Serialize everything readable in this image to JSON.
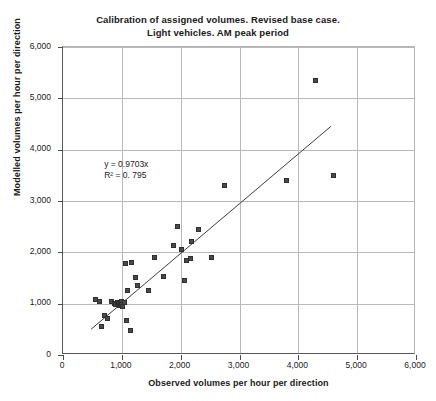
{
  "chart_data": {
    "type": "scatter",
    "title": "Calibration of assigned volumes. Revised base case.\nLight vehicles. AM peak period",
    "title_line1": "Calibration of assigned volumes. Revised base case.",
    "title_line2": "Light vehicles. AM peak period",
    "xlabel": "Observed  volumes per hour per direction",
    "ylabel": "Modelled volumes per hour per direction",
    "xlim": [
      0,
      6000
    ],
    "ylim": [
      0,
      6000
    ],
    "xticks": [
      0,
      1000,
      2000,
      3000,
      4000,
      5000,
      6000
    ],
    "yticks": [
      0,
      1000,
      2000,
      3000,
      4000,
      5000,
      6000
    ],
    "xticklabels": [
      "0",
      "1,000",
      "2,000",
      "3,000",
      "4,000",
      "5,000",
      "6,000"
    ],
    "yticklabels": [
      "0",
      "1,000",
      "2,000",
      "3,000",
      "4,000",
      "5,000",
      "6,000"
    ],
    "grid": true,
    "grid_color": "#b9b9b9",
    "marker_color": "#4a4a4a",
    "marker_shape": "square",
    "legend": null,
    "annotations": [
      {
        "text": "y = 0.9703x",
        "x": 700,
        "y": 3700
      },
      {
        "text": "R² = 0. 795",
        "x": 700,
        "y": 3480
      }
    ],
    "equation_label": "y = 0.9703x",
    "r2_label": "R² = 0. 795",
    "slope": 0.9703,
    "r_squared": 0.795,
    "trendline": {
      "type": "linear",
      "x0": 480,
      "y0": 466,
      "x1": 4580,
      "y1": 4444
    },
    "series": [
      {
        "name": "Light vehicles AM peak",
        "points": [
          [
            560,
            1080
          ],
          [
            620,
            1040
          ],
          [
            650,
            550
          ],
          [
            700,
            770
          ],
          [
            760,
            720
          ],
          [
            820,
            1050
          ],
          [
            870,
            1010
          ],
          [
            900,
            980
          ],
          [
            930,
            1030
          ],
          [
            950,
            1000
          ],
          [
            960,
            960
          ],
          [
            980,
            1010
          ],
          [
            990,
            1050
          ],
          [
            1000,
            990
          ],
          [
            1010,
            940
          ],
          [
            1040,
            1020
          ],
          [
            1060,
            1790
          ],
          [
            1080,
            680
          ],
          [
            1100,
            1260
          ],
          [
            1150,
            480
          ],
          [
            1170,
            1800
          ],
          [
            1230,
            1510
          ],
          [
            1270,
            1350
          ],
          [
            1450,
            1260
          ],
          [
            1560,
            1900
          ],
          [
            1700,
            1520
          ],
          [
            1880,
            2130
          ],
          [
            1950,
            2500
          ],
          [
            2010,
            2060
          ],
          [
            2060,
            1450
          ],
          [
            2100,
            1850
          ],
          [
            2160,
            1880
          ],
          [
            2180,
            2210
          ],
          [
            2300,
            2450
          ],
          [
            2520,
            1900
          ],
          [
            2750,
            3300
          ],
          [
            3800,
            3400
          ],
          [
            4300,
            5350
          ],
          [
            4600,
            3500
          ]
        ]
      }
    ]
  }
}
